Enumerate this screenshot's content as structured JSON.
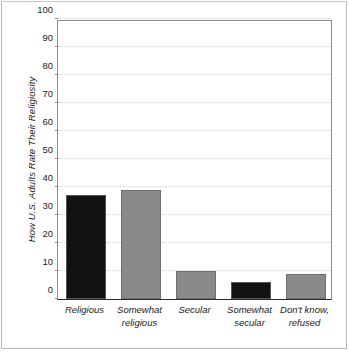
{
  "figure": {
    "background_color": "#ffffff",
    "frame_color": "#8c8c8c",
    "axis_color": "#2b2b2b",
    "gridline_color": "#d2d2d2"
  },
  "chart_data": {
    "type": "bar",
    "title": "",
    "xlabel": "",
    "ylabel": "How U.S. Adults Rate Their Religiosity",
    "categories": [
      "Religious",
      "Somewhat religious",
      "Secular",
      "Somewhat secular",
      "Don't know, refused"
    ],
    "category_lines": [
      [
        "Religious"
      ],
      [
        "Somewhat",
        "religious"
      ],
      [
        "Secular"
      ],
      [
        "Somewhat",
        "secular"
      ],
      [
        "Don't know,",
        "refused"
      ]
    ],
    "values": [
      37,
      39,
      10,
      6,
      9
    ],
    "bar_colors": [
      "#111111",
      "#8a8a8a",
      "#8a8a8a",
      "#111111",
      "#8a8a8a"
    ],
    "ylim": [
      0,
      100
    ],
    "yticks": [
      0,
      10,
      20,
      30,
      40,
      50,
      60,
      70,
      80,
      90,
      100
    ],
    "ytick_labels": [
      "0",
      "10",
      "20",
      "30",
      "40",
      "50",
      "60",
      "70",
      "80",
      "90",
      "100"
    ],
    "grid": true,
    "grid_axis": "y",
    "legend": null,
    "legend_position": "none"
  }
}
